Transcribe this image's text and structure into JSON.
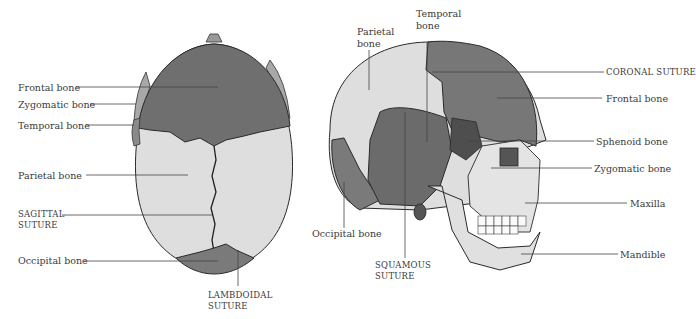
{
  "figure": {
    "colors": {
      "dark_bone": "#6e6e6e",
      "light_bone": "#dcdcdc",
      "mid_bone": "#8a8a8a",
      "outline": "#2a2a2a",
      "leader": "#444444",
      "background": "#ffffff"
    },
    "superior_view": {
      "labels": {
        "frontal": "Frontal bone",
        "zygomatic": "Zygomatic bone",
        "temporal": "Temporal bone",
        "parietal": "Parietal bone",
        "sagittal_1": "SAGITTAL",
        "sagittal_2": "SUTURE",
        "occipital": "Occipital bone",
        "lambdoidal_1": "LAMBDOIDAL",
        "lambdoidal_2": "SUTURE"
      }
    },
    "lateral_view": {
      "labels": {
        "parietal_1": "Parietal",
        "parietal_2": "bone",
        "temporal_1": "Temporal",
        "temporal_2": "bone",
        "coronal": "CORONAL SUTURE",
        "frontal": "Frontal bone",
        "sphenoid": "Sphenoid bone",
        "zygomatic": "Zygomatic bone",
        "maxilla": "Maxilla",
        "mandible": "Mandible",
        "occipital": "Occipital bone",
        "squamous_1": "SQUAMOUS",
        "squamous_2": "SUTURE"
      }
    }
  }
}
